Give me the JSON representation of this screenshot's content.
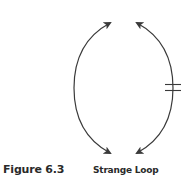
{
  "figure": {
    "number_label": "Figure 6.3",
    "caption": "Strange Loop"
  },
  "diagram": {
    "type": "strange-loop",
    "stroke_color": "#3a3a3a",
    "arcs": [
      {
        "name": "left-arc",
        "direction": "bidirectional",
        "arrowheads": [
          "top",
          "bottom"
        ]
      },
      {
        "name": "right-arc",
        "direction": "bidirectional",
        "arrowheads": [
          "top",
          "bottom"
        ],
        "marker": "double-hash (break)"
      }
    ]
  }
}
